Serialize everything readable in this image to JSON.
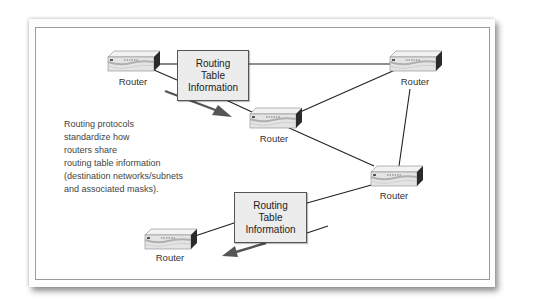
{
  "figure": {
    "routers": [
      {
        "id": "r1",
        "label": "Router"
      },
      {
        "id": "r2",
        "label": "Router"
      },
      {
        "id": "r3",
        "label": "Router"
      },
      {
        "id": "r4",
        "label": "Router"
      },
      {
        "id": "r5",
        "label": "Router"
      }
    ],
    "info_boxes": [
      {
        "id": "top",
        "lines": [
          "Routing",
          "Table",
          "Information"
        ]
      },
      {
        "id": "bottom",
        "lines": [
          "Routing",
          "Table",
          "Information"
        ]
      }
    ],
    "description_lines": [
      "Routing protocols",
      "standardize how",
      "routers share",
      "routing table information",
      "(destination networks/subnets",
      "and associated masks)."
    ],
    "connections": [
      [
        "r1",
        "top-box"
      ],
      [
        "r1",
        "r3"
      ],
      [
        "top-box",
        "r2"
      ],
      [
        "r2",
        "r3"
      ],
      [
        "r2",
        "r4"
      ],
      [
        "r3",
        "r4"
      ],
      [
        "r4",
        "bottom-box"
      ],
      [
        "bottom-box",
        "r5"
      ]
    ],
    "colors": {
      "line": "#222222",
      "arrow": "#555555",
      "box_fill": "#ececec",
      "router_body": "#e4e4e4",
      "router_side": "#2a2a2a"
    }
  }
}
